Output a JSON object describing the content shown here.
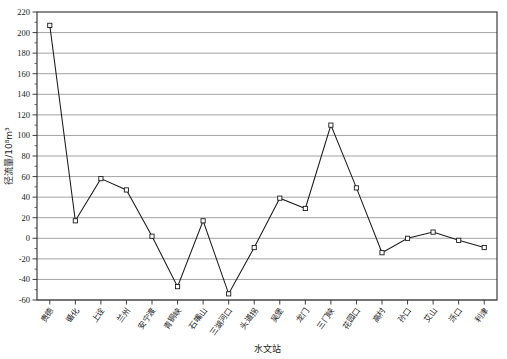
{
  "chart_data": {
    "type": "line",
    "title": "",
    "xlabel": "水文站",
    "ylabel": "径流量/10⁸m³",
    "ylim": [
      -60,
      220
    ],
    "ytick_step": 20,
    "grid": true,
    "legend": "none",
    "marker": "open-square",
    "line_color": "#1b1b1b",
    "grid_color": "#7a7a7a",
    "categories": [
      "贵德",
      "循化",
      "上诠",
      "兰州",
      "安宁渡",
      "青铜峡",
      "石嘴山",
      "三湖河口",
      "头道拐",
      "吴堡",
      "龙门",
      "三门峡",
      "花园口",
      "高村",
      "孙口",
      "艾山",
      "泺口",
      "利津"
    ],
    "values": [
      207,
      17,
      58,
      47,
      2,
      -47,
      17,
      -54,
      -9,
      39,
      29,
      110,
      49,
      -14,
      0,
      6,
      -2,
      -9
    ],
    "yticks": [
      -60,
      -40,
      -20,
      0,
      20,
      40,
      60,
      80,
      100,
      120,
      140,
      160,
      180,
      200,
      220
    ],
    "ytick_labels": [
      "-60",
      "-40",
      "-20",
      "0",
      "20",
      "40",
      "60",
      "80",
      "100",
      "120",
      "140",
      "160",
      "180",
      "200",
      "220"
    ]
  }
}
